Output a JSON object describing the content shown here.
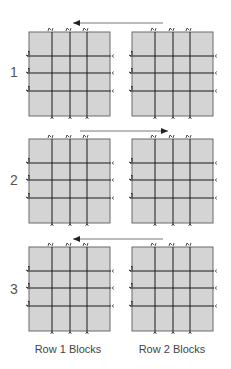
{
  "colors": {
    "block_fill": "#d4d4d4",
    "block_border": "#6a6a6a",
    "grid_line": "#1a1a1a",
    "arrow": "#555555",
    "text": "#555555"
  },
  "rows": [
    {
      "label": "1",
      "label_x": 10,
      "label_y": 64,
      "top": 32,
      "arrow": {
        "y": 23,
        "x1": 163,
        "x2": 73,
        "direction": "left"
      }
    },
    {
      "label": "2",
      "label_x": 10,
      "label_y": 172,
      "top": 139,
      "arrow": {
        "y": 131,
        "x1": 80,
        "x2": 168,
        "direction": "right"
      }
    },
    {
      "label": "3",
      "label_x": 10,
      "label_y": 281,
      "top": 247,
      "arrow": {
        "y": 239,
        "x1": 163,
        "x2": 73,
        "direction": "left"
      }
    }
  ],
  "blocks": {
    "lefts": [
      29,
      132
    ],
    "width": 81,
    "height": 84,
    "v_lines_offset": [
      23,
      41,
      58
    ],
    "h_lines_offset": [
      24,
      41,
      59
    ]
  },
  "columns": [
    {
      "label": "Row 1 Blocks",
      "x": 23,
      "y": 343
    },
    {
      "label": "Row 2 Blocks",
      "x": 127,
      "y": 343
    }
  ]
}
